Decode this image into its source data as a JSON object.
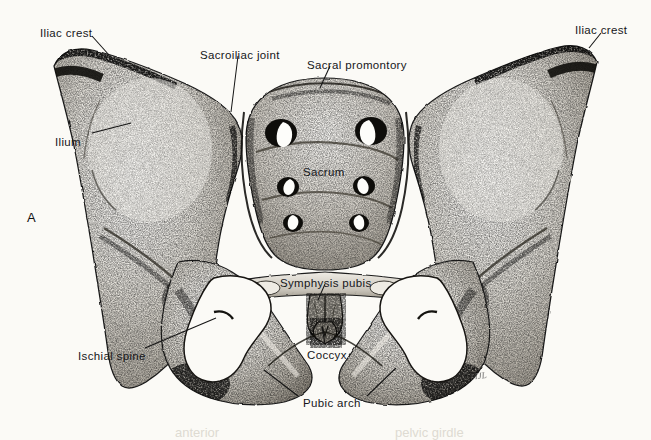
{
  "figure": {
    "panel_marker": "A",
    "signature": "MJL",
    "background_color": "#fbfaf6",
    "ink_color": "#16161a",
    "technique": "stipple pen-and-ink illustration"
  },
  "labels": [
    {
      "id": "iliac-crest-left",
      "text": "Iliac crest",
      "x": 40,
      "y": 28,
      "anchor": "start"
    },
    {
      "id": "iliac-crest-right",
      "text": "Iliac crest",
      "x": 575,
      "y": 25,
      "anchor": "start"
    },
    {
      "id": "sacroiliac-joint",
      "text": "Sacroiliac joint",
      "x": 200,
      "y": 50,
      "anchor": "start"
    },
    {
      "id": "sacral-promontory",
      "text": "Sacral promontory",
      "x": 307,
      "y": 60,
      "anchor": "start"
    },
    {
      "id": "ilium",
      "text": "Ilium",
      "x": 55,
      "y": 137,
      "anchor": "start"
    },
    {
      "id": "sacrum",
      "text": "Sacrum",
      "x": 303,
      "y": 167,
      "anchor": "start"
    },
    {
      "id": "symphysis-pubis",
      "text": "Symphysis pubis",
      "x": 280,
      "y": 278,
      "anchor": "start"
    },
    {
      "id": "ischial-spine",
      "text": "Ischial spine",
      "x": 78,
      "y": 351,
      "anchor": "start"
    },
    {
      "id": "coccyx",
      "text": "Coccyx",
      "x": 307,
      "y": 350,
      "anchor": "start"
    },
    {
      "id": "pubic-arch",
      "text": "Pubic arch",
      "x": 303,
      "y": 398,
      "anchor": "start"
    }
  ],
  "leaders": [
    {
      "id": "leader-iliac-crest-left",
      "points": "92,36 109,55"
    },
    {
      "id": "leader-iliac-crest-right",
      "points": "601,33 589,48"
    },
    {
      "id": "leader-sacroiliac-joint",
      "points": "238,56 231,112"
    },
    {
      "id": "leader-sacral-promontory",
      "points": "330,66 320,88"
    },
    {
      "id": "leader-ilium",
      "points": "92,133 131,123"
    },
    {
      "id": "leader-symphysis-pubis",
      "points": "325,284 318,300"
    },
    {
      "id": "leader-ischial-spine",
      "points": "145,348 216,318"
    },
    {
      "id": "leader-coccyx",
      "points": "325,344 322,327"
    },
    {
      "id": "leader-pubic-arch-left",
      "points": "298,396 264,370"
    },
    {
      "id": "leader-pubic-arch-right",
      "points": "367,396 396,368"
    }
  ],
  "bleed_text": [
    {
      "id": "bleed-left",
      "text": "anterior",
      "x": 175,
      "y": 425
    },
    {
      "id": "bleed-right",
      "text": "pelvic girdle",
      "x": 395,
      "y": 425
    }
  ],
  "anatomy_regions": [
    {
      "id": "ilium-left",
      "name": "Left ilium (wing)"
    },
    {
      "id": "ilium-right",
      "name": "Right ilium (wing)"
    },
    {
      "id": "sacrum-body",
      "name": "Sacrum"
    },
    {
      "id": "coccyx-body",
      "name": "Coccyx"
    },
    {
      "id": "pubic-symphysis",
      "name": "Symphysis pubis"
    },
    {
      "id": "obturator-left",
      "name": "Left obturator foramen"
    },
    {
      "id": "obturator-right",
      "name": "Right obturator foramen"
    },
    {
      "id": "sacral-foramina",
      "name": "Anterior sacral foramina",
      "count": 6
    }
  ]
}
